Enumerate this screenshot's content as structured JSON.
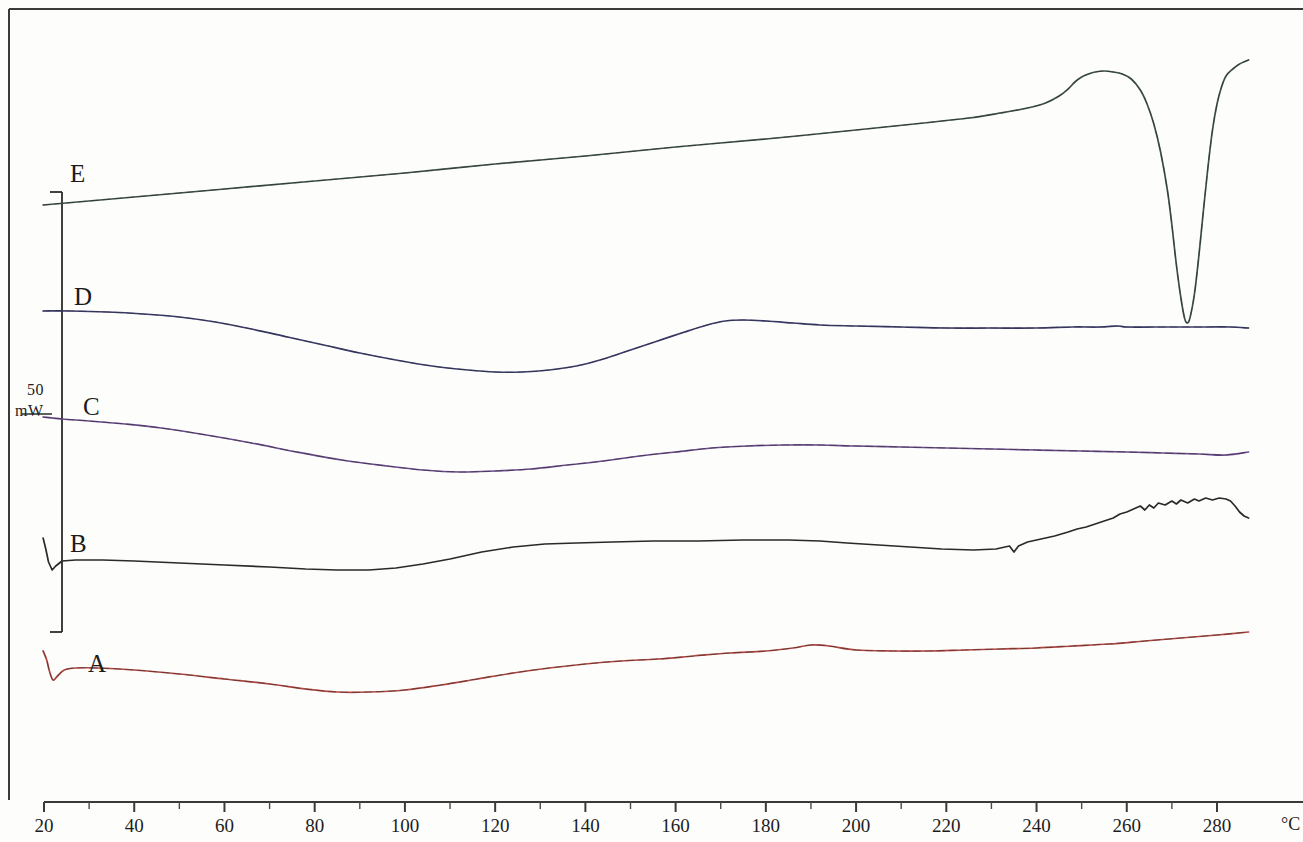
{
  "figure": {
    "kind": "dsc-thermogram",
    "background_color": "#fdfdfc",
    "frame_color": "#3a3a3a"
  },
  "scale_bar": {
    "value": "50",
    "unit": "mW",
    "color": "#2b2b2b"
  },
  "axis_unit_label": "°C",
  "chart_data": {
    "type": "line",
    "title": "",
    "subtitle": "",
    "xlabel": "°C",
    "ylabel": "Heat flow (mW, endo down)",
    "xlim": [
      16,
      288
    ],
    "ylim": [
      0,
      1
    ],
    "grid": false,
    "legend": "inline-curve-labels",
    "xticks": [
      20,
      40,
      60,
      80,
      100,
      120,
      140,
      160,
      180,
      200,
      220,
      240,
      260,
      280
    ],
    "xtick_labels": [
      "20",
      "40",
      "60",
      "80",
      "100",
      "120",
      "140",
      "160",
      "180",
      "200",
      "220",
      "240",
      "260",
      "280"
    ],
    "xminorticks": [
      30,
      50,
      70,
      90,
      110,
      130,
      150,
      170,
      190,
      210,
      230,
      250,
      270
    ],
    "scale_bar": {
      "value": 50,
      "unit": "mW",
      "from_label": "E",
      "to_label": "A"
    },
    "series": [
      {
        "name": "A",
        "label": "A",
        "color": "#b2463f",
        "label_x": 88,
        "label_y": 650,
        "points": [
          [
            19.8,
            651
          ],
          [
            20.6,
            660
          ],
          [
            21.2,
            671
          ],
          [
            22.0,
            680
          ],
          [
            23.0,
            676
          ],
          [
            24.5,
            670
          ],
          [
            27.0,
            668
          ],
          [
            32.0,
            668
          ],
          [
            40.0,
            670
          ],
          [
            50.0,
            674
          ],
          [
            60.0,
            679
          ],
          [
            70.0,
            684
          ],
          [
            78.0,
            689
          ],
          [
            85.0,
            692
          ],
          [
            92.0,
            692
          ],
          [
            100.0,
            690
          ],
          [
            108.0,
            685
          ],
          [
            116.0,
            679
          ],
          [
            124.0,
            673
          ],
          [
            132.0,
            668
          ],
          [
            140.0,
            664
          ],
          [
            148.0,
            661
          ],
          [
            156.0,
            659
          ],
          [
            164.0,
            656
          ],
          [
            172.0,
            653
          ],
          [
            180.0,
            651
          ],
          [
            186.0,
            648
          ],
          [
            190.0,
            645
          ],
          [
            194.0,
            646
          ],
          [
            200.0,
            650
          ],
          [
            208.0,
            651
          ],
          [
            216.0,
            651
          ],
          [
            224.0,
            650
          ],
          [
            232.0,
            649
          ],
          [
            240.0,
            648
          ],
          [
            248.0,
            646
          ],
          [
            256.0,
            644
          ],
          [
            264.0,
            641
          ],
          [
            272.0,
            638
          ],
          [
            280.0,
            635
          ],
          [
            287.0,
            632
          ]
        ]
      },
      {
        "name": "B",
        "label": "B",
        "color": "#2a2a2a",
        "label_x": 70,
        "label_y": 530,
        "points": [
          [
            19.8,
            538
          ],
          [
            20.4,
            549
          ],
          [
            21.0,
            562
          ],
          [
            21.8,
            570
          ],
          [
            22.6,
            566
          ],
          [
            24.0,
            561
          ],
          [
            27.0,
            560
          ],
          [
            33.0,
            560
          ],
          [
            40.0,
            561
          ],
          [
            50.0,
            563
          ],
          [
            60.0,
            565
          ],
          [
            70.0,
            567
          ],
          [
            78.0,
            569
          ],
          [
            85.0,
            570
          ],
          [
            92.0,
            570
          ],
          [
            98.0,
            568
          ],
          [
            104.0,
            564
          ],
          [
            110.0,
            559
          ],
          [
            117.0,
            552
          ],
          [
            124.0,
            547
          ],
          [
            131.0,
            544
          ],
          [
            138.0,
            543
          ],
          [
            146.0,
            542
          ],
          [
            155.0,
            541
          ],
          [
            165.0,
            541
          ],
          [
            175.0,
            540
          ],
          [
            185.0,
            540
          ],
          [
            192.0,
            541
          ],
          [
            198.0,
            543
          ],
          [
            205.0,
            545
          ],
          [
            212.0,
            547
          ],
          [
            219.0,
            549
          ],
          [
            226.0,
            550
          ],
          [
            231.0,
            549
          ],
          [
            234.0,
            546
          ],
          [
            235.0,
            552
          ],
          [
            236.0,
            546
          ],
          [
            238.0,
            542
          ],
          [
            241.0,
            539
          ],
          [
            244.0,
            536
          ],
          [
            247.0,
            532
          ],
          [
            249.0,
            529
          ],
          [
            251.0,
            527
          ],
          [
            253.0,
            524
          ],
          [
            255.0,
            521
          ],
          [
            257.0,
            518
          ],
          [
            258.5,
            514
          ],
          [
            260.0,
            512
          ],
          [
            261.5,
            509
          ],
          [
            263.0,
            506
          ],
          [
            264.0,
            510
          ],
          [
            265.0,
            505
          ],
          [
            266.0,
            508
          ],
          [
            267.0,
            503
          ],
          [
            268.5,
            505
          ],
          [
            270.0,
            501
          ],
          [
            271.0,
            504
          ],
          [
            272.0,
            500
          ],
          [
            273.5,
            503
          ],
          [
            275.0,
            499
          ],
          [
            276.0,
            501
          ],
          [
            277.5,
            498
          ],
          [
            279.0,
            500
          ],
          [
            280.5,
            498
          ],
          [
            282.0,
            499
          ],
          [
            283.0,
            501
          ],
          [
            284.0,
            506
          ],
          [
            285.0,
            512
          ],
          [
            286.0,
            516
          ],
          [
            287.0,
            518
          ]
        ]
      },
      {
        "name": "C",
        "label": "C",
        "color": "#6b4a8c",
        "label_x": 83,
        "label_y": 393,
        "points": [
          [
            19.8,
            417
          ],
          [
            24.0,
            419
          ],
          [
            30.0,
            421
          ],
          [
            38.0,
            424
          ],
          [
            46.0,
            428
          ],
          [
            56.0,
            435
          ],
          [
            66.0,
            443
          ],
          [
            76.0,
            452
          ],
          [
            86.0,
            460
          ],
          [
            96.0,
            466
          ],
          [
            104.0,
            470
          ],
          [
            112.0,
            472
          ],
          [
            120.0,
            471
          ],
          [
            128.0,
            469
          ],
          [
            136.0,
            465
          ],
          [
            144.0,
            461
          ],
          [
            152.0,
            456
          ],
          [
            160.0,
            452
          ],
          [
            168.0,
            448
          ],
          [
            176.0,
            446
          ],
          [
            184.0,
            445
          ],
          [
            192.0,
            445
          ],
          [
            200.0,
            446
          ],
          [
            210.0,
            447
          ],
          [
            220.0,
            448
          ],
          [
            230.0,
            449
          ],
          [
            240.0,
            450
          ],
          [
            250.0,
            451
          ],
          [
            260.0,
            452
          ],
          [
            268.0,
            453
          ],
          [
            276.0,
            454
          ],
          [
            282.0,
            455
          ],
          [
            287.0,
            452
          ]
        ]
      },
      {
        "name": "D",
        "label": "D",
        "color": "#3b3b6e",
        "label_x": 74,
        "label_y": 283,
        "points": [
          [
            19.8,
            311
          ],
          [
            26.0,
            311
          ],
          [
            34.0,
            312
          ],
          [
            42.0,
            314
          ],
          [
            50.0,
            317
          ],
          [
            58.0,
            322
          ],
          [
            66.0,
            329
          ],
          [
            74.0,
            337
          ],
          [
            82.0,
            345
          ],
          [
            90.0,
            353
          ],
          [
            98.0,
            360
          ],
          [
            106.0,
            366
          ],
          [
            114.0,
            370
          ],
          [
            120.0,
            372
          ],
          [
            126.0,
            372
          ],
          [
            132.0,
            370
          ],
          [
            138.0,
            366
          ],
          [
            144.0,
            359
          ],
          [
            150.0,
            350
          ],
          [
            156.0,
            341
          ],
          [
            162.0,
            332
          ],
          [
            167.0,
            325
          ],
          [
            171.0,
            321
          ],
          [
            175.0,
            320
          ],
          [
            180.0,
            321
          ],
          [
            186.0,
            323
          ],
          [
            192.0,
            325
          ],
          [
            200.0,
            326
          ],
          [
            210.0,
            327
          ],
          [
            220.0,
            328
          ],
          [
            230.0,
            328
          ],
          [
            240.0,
            328
          ],
          [
            248.0,
            327
          ],
          [
            254.0,
            327
          ],
          [
            258.0,
            326
          ],
          [
            260.0,
            327
          ],
          [
            266.0,
            327
          ],
          [
            272.0,
            327
          ],
          [
            278.0,
            327
          ],
          [
            283.0,
            327
          ],
          [
            287.0,
            328
          ]
        ]
      },
      {
        "name": "E",
        "label": "E",
        "color": "#3d5048",
        "label_x": 70,
        "label_y": 160,
        "peak": {
          "temperature": 273,
          "type": "endotherm",
          "depth_px": 300
        },
        "points": [
          [
            19.8,
            205
          ],
          [
            40.0,
            197
          ],
          [
            60.0,
            189
          ],
          [
            80.0,
            181
          ],
          [
            100.0,
            173
          ],
          [
            120.0,
            164
          ],
          [
            140.0,
            156
          ],
          [
            160.0,
            147
          ],
          [
            180.0,
            139
          ],
          [
            200.0,
            130
          ],
          [
            215.0,
            123
          ],
          [
            225.0,
            118
          ],
          [
            232.0,
            113
          ],
          [
            238.0,
            108
          ],
          [
            242.0,
            103
          ],
          [
            245.0,
            96
          ],
          [
            247.0,
            89
          ],
          [
            248.5,
            82
          ],
          [
            250.0,
            77
          ],
          [
            251.5,
            74
          ],
          [
            253.0,
            72
          ],
          [
            255.0,
            71
          ],
          [
            257.0,
            72
          ],
          [
            259.0,
            74
          ],
          [
            261.0,
            79
          ],
          [
            263.0,
            90
          ],
          [
            264.5,
            104
          ],
          [
            266.0,
            124
          ],
          [
            267.5,
            152
          ],
          [
            269.0,
            190
          ],
          [
            270.0,
            225
          ],
          [
            271.0,
            265
          ],
          [
            272.0,
            298
          ],
          [
            272.8,
            318
          ],
          [
            273.4,
            323
          ],
          [
            274.0,
            318
          ],
          [
            275.0,
            294
          ],
          [
            276.0,
            255
          ],
          [
            277.0,
            210
          ],
          [
            278.0,
            167
          ],
          [
            279.0,
            130
          ],
          [
            280.0,
            104
          ],
          [
            281.0,
            87
          ],
          [
            282.0,
            76
          ],
          [
            283.5,
            69
          ],
          [
            285.0,
            64
          ],
          [
            287.0,
            60
          ]
        ]
      }
    ]
  },
  "curve_labels": [
    {
      "id": "A",
      "text": "A"
    },
    {
      "id": "B",
      "text": "B"
    },
    {
      "id": "C",
      "text": "C"
    },
    {
      "id": "D",
      "text": "D"
    },
    {
      "id": "E",
      "text": "E"
    }
  ]
}
